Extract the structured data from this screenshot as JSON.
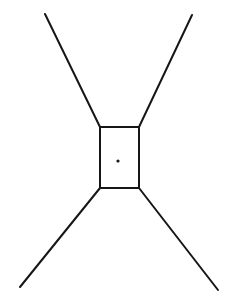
{
  "figure": {
    "background_color": "#ffffff",
    "ink_color": "#161616",
    "canvas": {
      "width": 238,
      "height": 299
    },
    "style": "hand-drawn ink line art",
    "center_vertex": {
      "name": "center-dot",
      "x": 118,
      "y": 161,
      "radius": 1.6
    },
    "box": {
      "name": "central-rectangle",
      "x": 100,
      "y": 127,
      "width": 39,
      "height": 61,
      "stroke_width": 2.0,
      "corners": {
        "top_left": {
          "x": 100,
          "y": 127
        },
        "top_right": {
          "x": 139,
          "y": 127
        },
        "bottom_right": {
          "x": 139,
          "y": 188
        },
        "bottom_left": {
          "x": 100,
          "y": 188
        }
      }
    },
    "legs": [
      {
        "name": "leg-upper-left",
        "x1": 45,
        "y1": 14,
        "x2": 100,
        "y2": 127,
        "stroke_width": 2.0
      },
      {
        "name": "leg-upper-right",
        "x1": 192,
        "y1": 15,
        "x2": 139,
        "y2": 127,
        "stroke_width": 2.0
      },
      {
        "name": "leg-lower-left",
        "x1": 100,
        "y1": 188,
        "x2": 20,
        "y2": 287,
        "stroke_width": 2.0
      },
      {
        "name": "leg-lower-right",
        "x1": 139,
        "y1": 188,
        "x2": 218,
        "y2": 290,
        "stroke_width": 2.0
      }
    ]
  }
}
